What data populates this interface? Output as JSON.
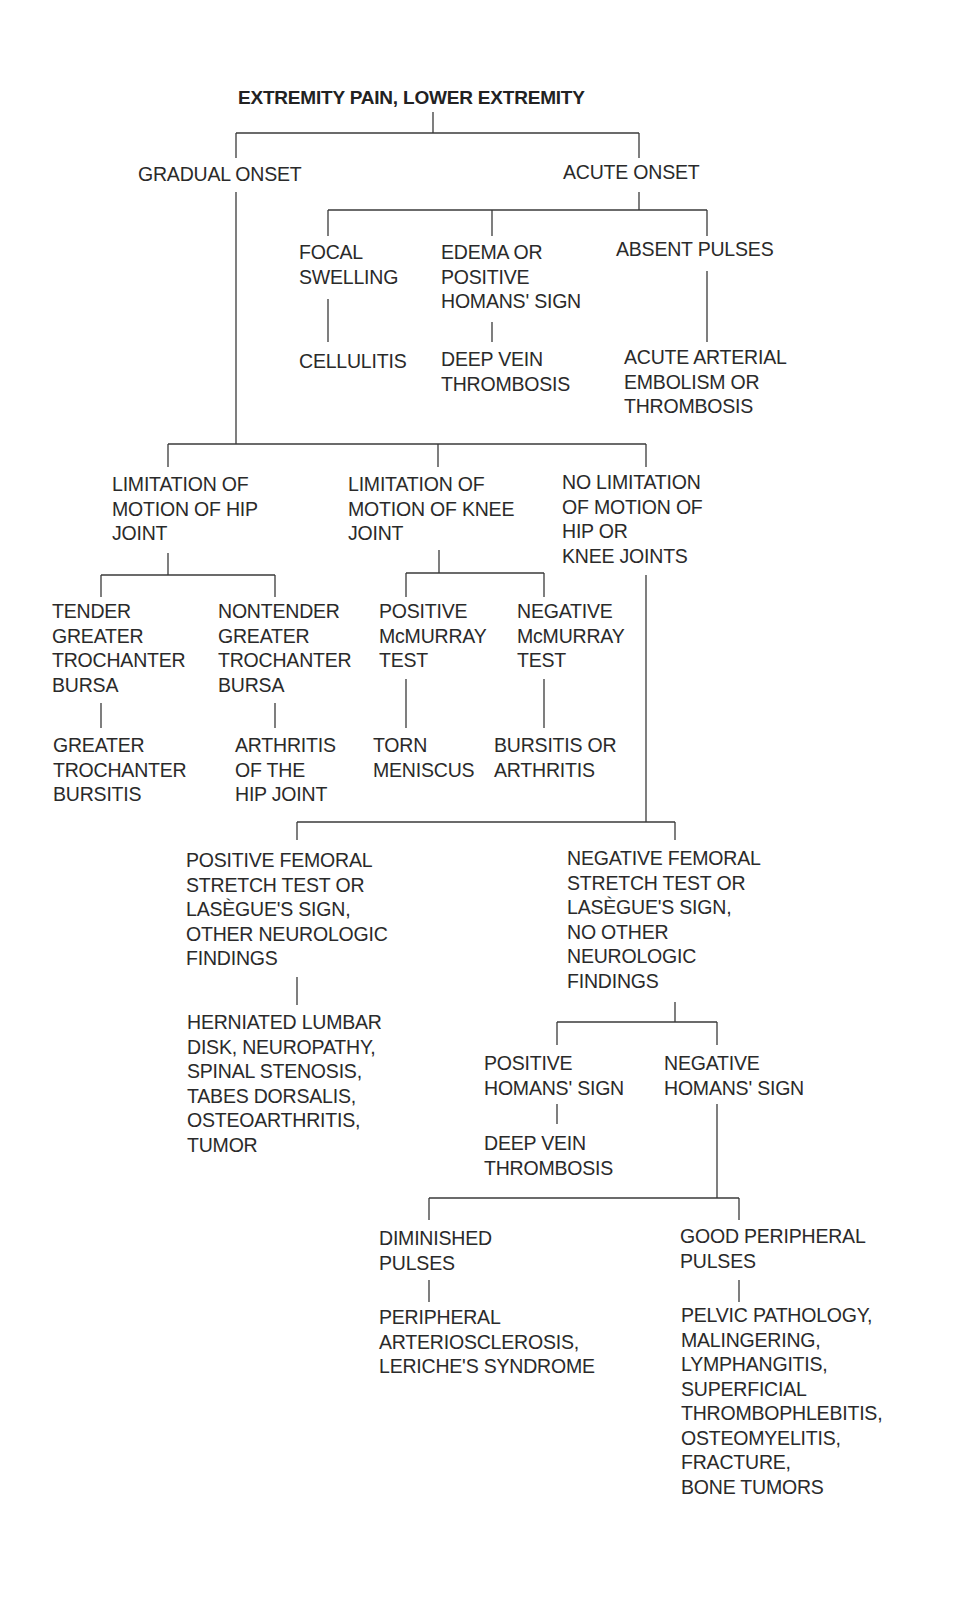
{
  "diagram": {
    "title": "EXTREMITY PAIN, LOWER EXTREMITY",
    "nodes": {
      "gradual_onset": "GRADUAL ONSET",
      "acute_onset": "ACUTE ONSET",
      "focal_swelling": "FOCAL\nSWELLING",
      "edema_homans": "EDEMA OR\nPOSITIVE\nHOMANS' SIGN",
      "absent_pulses": "ABSENT PULSES",
      "cellulitis": "CELLULITIS",
      "dvt_1": "DEEP VEIN\nTHROMBOSIS",
      "arterial_embolism": "ACUTE ARTERIAL\nEMBOLISM OR\nTHROMBOSIS",
      "limit_hip": "LIMITATION OF\nMOTION OF HIP\nJOINT",
      "limit_knee": "LIMITATION OF\nMOTION OF KNEE\nJOINT",
      "no_limit": "NO LIMITATION\nOF MOTION OF\nHIP OR\nKNEE JOINTS",
      "tender_bursa": "TENDER\nGREATER\nTROCHANTER\nBURSA",
      "nontender_bursa": "NONTENDER\nGREATER\nTROCHANTER\nBURSA",
      "pos_mcmurray": "POSITIVE\nMcMURRAY\nTEST",
      "neg_mcmurray": "NEGATIVE\nMcMURRAY\nTEST",
      "troch_bursitis": "GREATER\nTROCHANTER\nBURSITIS",
      "hip_arthritis": "ARTHRITIS\nOF THE\nHIP JOINT",
      "torn_meniscus": "TORN\nMENISCUS",
      "bursitis_arthritis": "BURSITIS OR\nARTHRITIS",
      "pos_femoral": "POSITIVE FEMORAL\nSTRETCH TEST OR\nLASÈGUE'S SIGN,\nOTHER NEUROLOGIC\nFINDINGS",
      "neg_femoral": "NEGATIVE FEMORAL\nSTRETCH TEST OR\nLASÈGUE'S SIGN,\nNO OTHER\nNEUROLOGIC\nFINDINGS",
      "herniated_disk": "HERNIATED LUMBAR\nDISK, NEUROPATHY,\nSPINAL STENOSIS,\nTABES DORSALIS,\nOSTEOARTHRITIS,\nTUMOR",
      "pos_homans": "POSITIVE\nHOMANS' SIGN",
      "neg_homans": "NEGATIVE\nHOMANS' SIGN",
      "dvt_2": "DEEP VEIN\nTHROMBOSIS",
      "diminished_pulses": "DIMINISHED\nPULSES",
      "good_pulses": "GOOD PERIPHERAL\nPULSES",
      "peripheral_arterio": "PERIPHERAL\nARTERIOSCLEROSIS,\nLERICHE'S SYNDROME",
      "pelvic_pathology": "PELVIC PATHOLOGY,\nMALINGERING,\nLYMPHANGITIS,\nSUPERFICIAL\nTHROMBOPHLEBITIS,\nOSTEOMYELITIS,\nFRACTURE,\nBONE TUMORS"
    },
    "line_color": "#3a3a3a",
    "text_color": "#2a2a2a"
  }
}
